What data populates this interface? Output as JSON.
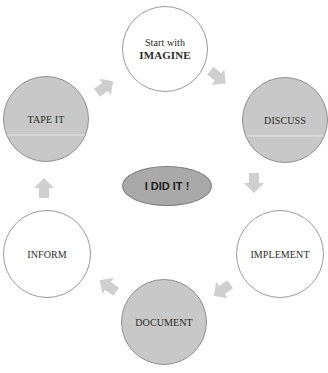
{
  "diagram": {
    "type": "cycle",
    "colors": {
      "white_node_fill": "#ffffff",
      "gray_node_fill": "#c8c8c8",
      "node_border": "#9a9a9a",
      "center_fill": "#a9a9a9",
      "arrow_fill": "#cfcfcf"
    },
    "nodes": [
      {
        "id": "imagine",
        "line1": "Start with",
        "line2": "IMAGINE",
        "style": "white"
      },
      {
        "id": "discuss",
        "label": "DISCUSS",
        "style": "gray"
      },
      {
        "id": "implement",
        "label": "IMPLEMENT",
        "style": "white"
      },
      {
        "id": "document",
        "label": "DOCUMENT",
        "style": "gray"
      },
      {
        "id": "inform",
        "label": "INFORM",
        "style": "white"
      },
      {
        "id": "tape_it",
        "label": "TAPE IT",
        "style": "gray"
      }
    ],
    "center": {
      "label": "I DID IT !"
    },
    "arrows": [
      {
        "from": "imagine",
        "to": "discuss",
        "icon": "arrow-down-right"
      },
      {
        "from": "discuss",
        "to": "implement",
        "icon": "arrow-down"
      },
      {
        "from": "implement",
        "to": "document",
        "icon": "arrow-down-left"
      },
      {
        "from": "document",
        "to": "inform",
        "icon": "arrow-up-left"
      },
      {
        "from": "inform",
        "to": "tape_it",
        "icon": "arrow-up"
      },
      {
        "from": "tape_it",
        "to": "imagine",
        "icon": "arrow-up-right"
      }
    ]
  }
}
